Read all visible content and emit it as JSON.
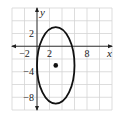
{
  "chart_data": {
    "type": "scatter",
    "title": "",
    "xlabel": "x",
    "ylabel": "y",
    "xlim": [
      -4,
      12
    ],
    "ylim": [
      -10,
      6
    ],
    "grid": true,
    "grid_step": 2,
    "x_tick_labels": [
      {
        "value": -2,
        "label": "−2"
      },
      {
        "value": 2,
        "label": "2"
      },
      {
        "value": 8,
        "label": "8"
      }
    ],
    "y_tick_labels": [
      {
        "value": 2,
        "label": "2"
      },
      {
        "value": -4,
        "label": "−4"
      },
      {
        "value": -8,
        "label": "−8"
      }
    ],
    "shapes": [
      {
        "type": "ellipse",
        "center": [
          3,
          -3
        ],
        "semi_axis_x": 3,
        "semi_axis_y": 6,
        "color": "#111111"
      }
    ],
    "points": [
      {
        "x": 3,
        "y": -3,
        "label": "center",
        "color": "#111111"
      }
    ]
  },
  "colors": {
    "grid": "#d4d4d4",
    "axis": "#222222",
    "curve": "#111111"
  }
}
